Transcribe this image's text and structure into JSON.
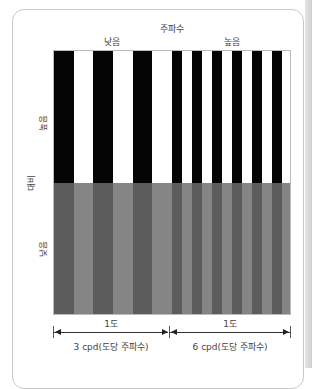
{
  "diagram": {
    "title": "주파수",
    "frequency_labels": {
      "low": "낮음",
      "high": "높음"
    },
    "contrast_axis": {
      "title": "대비",
      "high": "높음",
      "low": "낮음"
    },
    "bottom": {
      "left_span": "1도",
      "right_span": "1도",
      "left_caption": "3 cpd(도당 주파수)",
      "right_caption": "6 cpd(도당 주파수)"
    },
    "colors": {
      "high_dark": "#050505",
      "high_light": "#ffffff",
      "low_dark": "#5c5c5c",
      "low_light": "#858585"
    },
    "gratings": {
      "low_frequency_cycles": 3,
      "high_frequency_cycles": 6
    }
  }
}
